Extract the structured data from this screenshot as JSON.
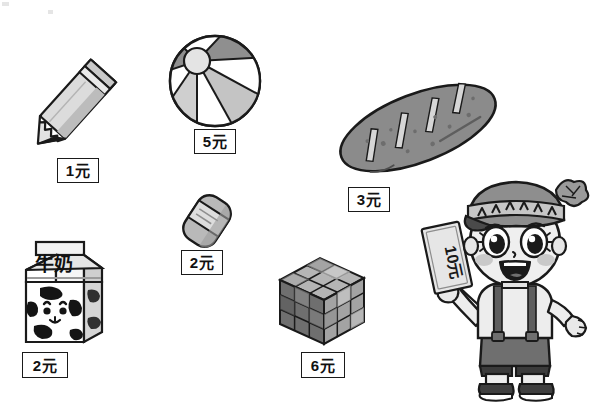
{
  "page": {
    "background_color": "#ffffff",
    "width": 601,
    "height": 406,
    "style": "black-and-white line-art worksheet illustration"
  },
  "currency_unit": "元",
  "items": [
    {
      "id": "pencil",
      "name": "pencil",
      "label_cn": "铅笔",
      "price": 1,
      "price_label": "1元",
      "tag": {
        "x": 57,
        "y": 158,
        "width": 42,
        "height": 25
      },
      "art": {
        "x": 20,
        "y": 55,
        "width": 90,
        "height": 105,
        "rotation": 45
      }
    },
    {
      "id": "beach-ball",
      "name": "beach ball",
      "label_cn": "皮球",
      "price": 5,
      "price_label": "5元",
      "tag": {
        "x": 194,
        "y": 129,
        "width": 42,
        "height": 25
      },
      "art": {
        "x": 167,
        "y": 33,
        "width": 94,
        "height": 94
      }
    },
    {
      "id": "bread",
      "name": "bread loaf",
      "label_cn": "面包",
      "price": 3,
      "price_label": "3元",
      "tag": {
        "x": 348,
        "y": 187,
        "width": 42,
        "height": 25
      },
      "art": {
        "x": 330,
        "y": 70,
        "width": 170,
        "height": 115,
        "rotation": -22
      }
    },
    {
      "id": "eraser",
      "name": "eraser",
      "label_cn": "橡皮",
      "price": 2,
      "price_label": "2元",
      "tag": {
        "x": 181,
        "y": 250,
        "width": 42,
        "height": 25
      },
      "art": {
        "x": 178,
        "y": 191,
        "width": 56,
        "height": 58,
        "rotation": 35
      }
    },
    {
      "id": "milk",
      "name": "milk carton",
      "label_cn": "牛奶",
      "package_text": "牛奶",
      "price": 2,
      "price_label": "2元",
      "tag": {
        "x": 22,
        "y": 352,
        "width": 46,
        "height": 26
      },
      "art": {
        "x": 16,
        "y": 240,
        "width": 96,
        "height": 110
      }
    },
    {
      "id": "rubiks-cube",
      "name": "rubiks cube",
      "label_cn": "魔方",
      "price": 6,
      "price_label": "6元",
      "tag": {
        "x": 301,
        "y": 352,
        "width": 44,
        "height": 26
      },
      "art": {
        "x": 276,
        "y": 256,
        "width": 92,
        "height": 92
      }
    }
  ],
  "character": {
    "id": "boy",
    "name": "smiling boy holding money",
    "money_note": "10元",
    "money_value": 10,
    "clothing": [
      "knit beanie with pom-pom",
      "light shirt",
      "dark shorts with suspenders",
      "sneakers"
    ],
    "art": {
      "x": 424,
      "y": 178,
      "width": 172,
      "height": 224
    }
  },
  "palette": {
    "outline": "#1a1a1a",
    "tag_border": "#1a1a1a",
    "tag_background": "#ffffff",
    "light_gray": "#dcdcdc",
    "mid_gray": "#9a9a9a",
    "dark_gray": "#6e6e6e",
    "darker_gray": "#4a4a4a",
    "skin": "#e8e8e8",
    "white": "#ffffff"
  }
}
